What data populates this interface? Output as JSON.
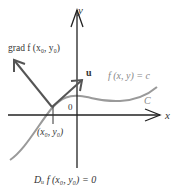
{
  "figure": {
    "axes": {
      "x_label": "x",
      "y_label": "y",
      "origin_label": "0"
    },
    "gradient_label": "grad f (x₀, y₀)",
    "unit_vector_label": "u",
    "level_curve_label": "f (x, y) = c",
    "curve_name": "C",
    "point_label": "(x₀, y₀)",
    "caption": "Dᵤ f (x₀, y₀) = 0",
    "colors": {
      "axes": "#222222",
      "vectors": "#555555",
      "curve": "#9a9a9a",
      "text": "#333333",
      "curve_label_text": "#888888"
    }
  }
}
